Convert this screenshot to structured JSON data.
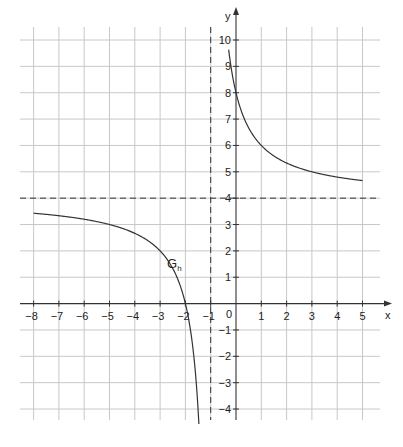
{
  "chart_data": {
    "type": "line",
    "title": "",
    "function_label": "G",
    "function_label_subscript": "h",
    "xlabel": "x",
    "ylabel": "y",
    "xlim": [
      -8,
      5
    ],
    "ylim": [
      -4,
      10
    ],
    "grid": true,
    "x_ticks": [
      -8,
      -7,
      -6,
      -5,
      -4,
      -3,
      -2,
      -1,
      0,
      1,
      2,
      3,
      4,
      5
    ],
    "x_tick_labels": [
      "−8",
      "−7",
      "−6",
      "−5",
      "−4",
      "−3",
      "−2",
      "−1",
      "0",
      "1",
      "2",
      "3",
      "4",
      "5"
    ],
    "y_ticks": [
      -4,
      -3,
      -2,
      -1,
      1,
      2,
      3,
      4,
      5,
      6,
      7,
      8,
      9,
      10
    ],
    "y_tick_labels": [
      "−4",
      "−3",
      "−2",
      "−1",
      "1",
      "2",
      "3",
      "4",
      "5",
      "6",
      "7",
      "8",
      "9",
      "10"
    ],
    "asymptotes": [
      {
        "type": "vertical",
        "value": -1,
        "style": "dashed"
      },
      {
        "type": "horizontal",
        "value": 4,
        "style": "dashed"
      }
    ],
    "series": [
      {
        "name": "G_h (left branch)",
        "x": [
          -8,
          -7,
          -6,
          -5,
          -4,
          -3,
          -2.5,
          -2,
          -1.75,
          -1.5,
          -1.4,
          -1.3,
          -1.25,
          -1.2,
          -1.15
        ],
        "y": [
          3.43,
          3.33,
          3.2,
          3.0,
          2.67,
          2.0,
          1.33,
          0.0,
          -1.33,
          -4.0,
          -6.0,
          -9.33,
          -12.0,
          -16.0,
          -22.67
        ]
      },
      {
        "name": "G_h (right branch)",
        "x": [
          -0.4,
          -0.3,
          -0.2,
          -0.1,
          0,
          0.25,
          0.5,
          1,
          1.5,
          2,
          3,
          4,
          5
        ],
        "y": [
          10.67,
          9.71,
          9.0,
          8.44,
          8.0,
          7.2,
          6.67,
          6.0,
          5.6,
          5.33,
          5.0,
          4.8,
          4.67
        ]
      }
    ],
    "annotations": [
      {
        "text": "G_h",
        "x": -2.6,
        "y": 1.4
      }
    ],
    "colors": {
      "grid": "#c8c8c8",
      "axis": "#333333",
      "curve": "#333333",
      "asymptote": "#333333",
      "background": "#ffffff"
    }
  }
}
